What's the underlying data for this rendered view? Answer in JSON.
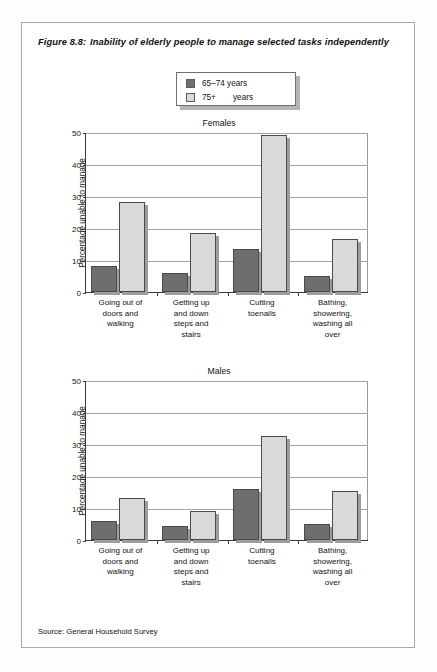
{
  "figure": {
    "number": "Figure 8.8:",
    "title": "Inability of elderly people to manage selected tasks independently",
    "source": "Source: General Household Survey"
  },
  "legend": {
    "items": [
      {
        "label": "65–74 years",
        "color": "#6e6e6e",
        "key": "65-74"
      },
      {
        "label_pre": "75+",
        "label_post": "years",
        "label": "75+    years",
        "color": "#d9d9d9",
        "key": "75+"
      }
    ]
  },
  "chart_data": [
    {
      "type": "bar",
      "title": "Females",
      "xlabel": "",
      "ylabel": "Percentage unable to manage",
      "ylim": [
        0,
        50
      ],
      "yticks": [
        0,
        10,
        20,
        30,
        40,
        50
      ],
      "grid": true,
      "legend_position": "top-center",
      "categories": [
        "Going out of doors and walking",
        "Getting up and down steps and stairs",
        "Cutting toenails",
        "Bathing, showering, washing all over"
      ],
      "category_lines": [
        [
          "Going out of",
          "doors and",
          "walking"
        ],
        [
          "Getting up",
          "and down",
          "steps and",
          "stairs"
        ],
        [
          "Cutting",
          "toenails"
        ],
        [
          "Bathing,",
          "showering,",
          "washing all",
          "over"
        ]
      ],
      "series": [
        {
          "name": "65–74 years",
          "color": "#6e6e6e",
          "values": [
            8,
            6,
            13.5,
            5
          ]
        },
        {
          "name": "75+ years",
          "color": "#d9d9d9",
          "values": [
            28,
            18.5,
            49,
            16.5
          ]
        }
      ]
    },
    {
      "type": "bar",
      "title": "Males",
      "xlabel": "",
      "ylabel": "Percentage unable to manage",
      "ylim": [
        0,
        50
      ],
      "yticks": [
        0,
        10,
        20,
        30,
        40,
        50
      ],
      "grid": true,
      "legend_position": "top-center",
      "categories": [
        "Going out of doors and walking",
        "Getting up and down steps and stairs",
        "Cutting toenails",
        "Bathing, showering, washing all over"
      ],
      "category_lines": [
        [
          "Going out of",
          "doors and",
          "walking"
        ],
        [
          "Getting up",
          "and down",
          "steps and",
          "stairs"
        ],
        [
          "Cutting",
          "toenails"
        ],
        [
          "Bathing,",
          "showering,",
          "washing all",
          "over"
        ]
      ],
      "series": [
        {
          "name": "65–74 years",
          "color": "#6e6e6e",
          "values": [
            5.8,
            4.5,
            16,
            5
          ]
        },
        {
          "name": "75+ years",
          "color": "#d9d9d9",
          "values": [
            13,
            9.2,
            32.5,
            15.2
          ]
        }
      ]
    }
  ]
}
